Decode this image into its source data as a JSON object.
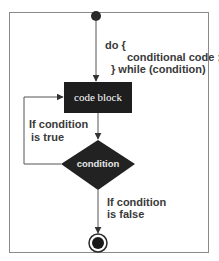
{
  "diagram": {
    "type": "flowchart",
    "nodes": {
      "start": {
        "shape": "filled-circle"
      },
      "code_block": {
        "shape": "rectangle",
        "label": "code block",
        "fill": "#1e1e1e"
      },
      "condition": {
        "shape": "diamond",
        "label": "condition",
        "fill": "#222222"
      },
      "end": {
        "shape": "bullseye-circle"
      }
    },
    "labels": {
      "do_line1": "do {",
      "do_line2": "conditional code ;",
      "do_line3": "} while (condition)",
      "true_line1": "If condition",
      "true_line2": "is true",
      "false_line1": "If condition",
      "false_line2": "is false"
    },
    "edges": [
      {
        "from": "start",
        "to": "code_block",
        "label": "do { conditional code ; } while (condition)"
      },
      {
        "from": "code_block",
        "to": "condition"
      },
      {
        "from": "condition",
        "to": "code_block",
        "label": "If condition is true"
      },
      {
        "from": "condition",
        "to": "end",
        "label": "If condition is false"
      }
    ],
    "colors": {
      "stroke": "#555555",
      "node_fill": "#1e1e1e",
      "text": "#3a3a3a"
    }
  }
}
